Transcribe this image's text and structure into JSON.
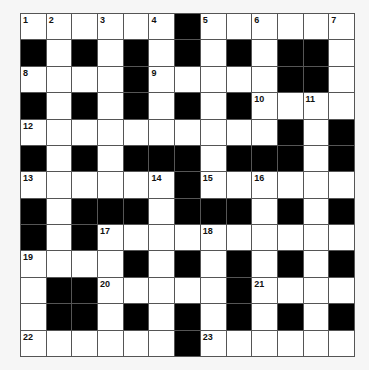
{
  "puzzle": {
    "type": "crossword",
    "rows": 13,
    "cols": 13,
    "layout": [
      "......#......",
      "#.#.#.#.#.##.",
      "....#.....##.",
      "#.#.#.#.#....",
      "..........#.#",
      "#.#.###.###.#",
      "......#......",
      "#.###.###.#.#",
      "#.#..........",
      "....#.#.#.#.#",
      ".##.....#....",
      ".##.#.#.#.#.#",
      "......#......"
    ],
    "numbers": [
      {
        "row": 0,
        "col": 0,
        "n": "1"
      },
      {
        "row": 0,
        "col": 1,
        "n": "2"
      },
      {
        "row": 0,
        "col": 3,
        "n": "3"
      },
      {
        "row": 0,
        "col": 5,
        "n": "4"
      },
      {
        "row": 0,
        "col": 7,
        "n": "5"
      },
      {
        "row": 0,
        "col": 9,
        "n": "6"
      },
      {
        "row": 0,
        "col": 12,
        "n": "7"
      },
      {
        "row": 2,
        "col": 0,
        "n": "8"
      },
      {
        "row": 2,
        "col": 5,
        "n": "9"
      },
      {
        "row": 3,
        "col": 9,
        "n": "10"
      },
      {
        "row": 3,
        "col": 11,
        "n": "11"
      },
      {
        "row": 4,
        "col": 0,
        "n": "12"
      },
      {
        "row": 6,
        "col": 0,
        "n": "13"
      },
      {
        "row": 6,
        "col": 5,
        "n": "14"
      },
      {
        "row": 6,
        "col": 7,
        "n": "15"
      },
      {
        "row": 6,
        "col": 9,
        "n": "16"
      },
      {
        "row": 8,
        "col": 3,
        "n": "17"
      },
      {
        "row": 8,
        "col": 7,
        "n": "18"
      },
      {
        "row": 9,
        "col": 0,
        "n": "19"
      },
      {
        "row": 10,
        "col": 3,
        "n": "20"
      },
      {
        "row": 10,
        "col": 9,
        "n": "21"
      },
      {
        "row": 12,
        "col": 0,
        "n": "22"
      },
      {
        "row": 12,
        "col": 7,
        "n": "23"
      }
    ],
    "entries": {},
    "colors": {
      "block": "#000000",
      "cell": "#ffffff",
      "gridline": "#555555",
      "background": "#f6f6f6"
    }
  }
}
